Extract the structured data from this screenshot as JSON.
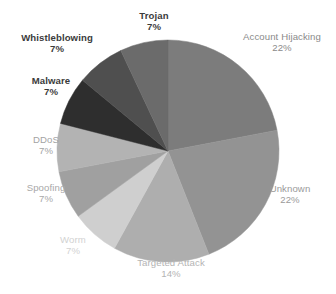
{
  "chart_data": {
    "type": "pie",
    "title": "",
    "subtitle": "",
    "xlabel": "",
    "ylabel": "",
    "legend_position": "none",
    "grid": false,
    "start_angle_deg": 0,
    "direction": "clockwise",
    "labels_show_name_and_percent": true,
    "categories": [
      "Account Hijacking",
      "Unknown",
      "Targeted Attack",
      "Worm",
      "Spoofing",
      "DDoS",
      "Malware",
      "Whistleblowing",
      "Trojan"
    ],
    "values": [
      22,
      22,
      14,
      7,
      7,
      7,
      7,
      7,
      7
    ],
    "value_unit": "%",
    "slices": [
      {
        "name": "Account Hijacking",
        "percent_label": "22%",
        "value": 22,
        "color": "#7c7c7c",
        "label_color": "#8a8a8a",
        "label_bold": false
      },
      {
        "name": "Unknown",
        "percent_label": "22%",
        "value": 22,
        "color": "#939393",
        "label_color": "#9a9a9a",
        "label_bold": false
      },
      {
        "name": "Targeted Attack",
        "percent_label": "14%",
        "value": 14,
        "color": "#aeaeae",
        "label_color": "#b4b4b4",
        "label_bold": false
      },
      {
        "name": "Worm",
        "percent_label": "7%",
        "value": 7,
        "color": "#cfcfcf",
        "label_color": "#d2d2d2",
        "label_bold": false
      },
      {
        "name": "Spoofing",
        "percent_label": "7%",
        "value": 7,
        "color": "#a0a0a0",
        "label_color": "#a8a8a8",
        "label_bold": false
      },
      {
        "name": "DDoS",
        "percent_label": "7%",
        "value": 7,
        "color": "#b3b3b3",
        "label_color": "#a3a3a3",
        "label_bold": false
      },
      {
        "name": "Malware",
        "percent_label": "7%",
        "value": 7,
        "color": "#2e2e2e",
        "label_color": "#3b3b3b",
        "label_bold": true
      },
      {
        "name": "Whistleblowing",
        "percent_label": "7%",
        "value": 7,
        "color": "#4f4f4f",
        "label_color": "#3b3b3b",
        "label_bold": true
      },
      {
        "name": "Trojan",
        "percent_label": "7%",
        "value": 7,
        "color": "#6b6b6b",
        "label_color": "#3b3b3b",
        "label_bold": true
      }
    ]
  },
  "geometry": {
    "center_x": 168,
    "center_y": 151,
    "radius": 111
  },
  "background_color": "#ffffff"
}
